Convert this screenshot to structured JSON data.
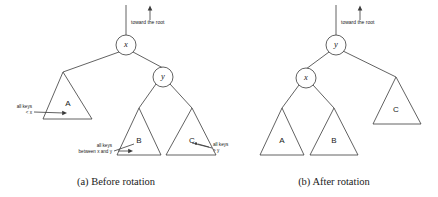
{
  "figure": {
    "background_color": "#ffffff",
    "stroke_color": "#3a3a3a",
    "text_color": "#1a1a1a"
  },
  "panels": [
    {
      "id": "before",
      "caption": "(a)  Before rotation",
      "root_pointer_label": "toward the root",
      "root_pointer_icon": "up-arrow-icon",
      "nodes": [
        {
          "id": "x",
          "label": "x"
        },
        {
          "id": "y",
          "label": "y"
        }
      ],
      "subtrees": [
        {
          "id": "A",
          "label": "A"
        },
        {
          "id": "B",
          "label": "B"
        },
        {
          "id": "C",
          "label": "C"
        }
      ],
      "annotations": [
        {
          "id": "keys-lt-x",
          "lines": [
            "all keys",
            "< x"
          ],
          "target": "A"
        },
        {
          "id": "keys-between",
          "lines": [
            "all keys",
            "between x and y"
          ],
          "target": "B"
        },
        {
          "id": "keys-gt-y",
          "lines": [
            "all keys",
            "> y"
          ],
          "target": "C"
        }
      ]
    },
    {
      "id": "after",
      "caption": "(b)  After rotation",
      "root_pointer_label": "toward the root",
      "root_pointer_icon": "up-arrow-icon",
      "nodes": [
        {
          "id": "y",
          "label": "y"
        },
        {
          "id": "x",
          "label": "x"
        }
      ],
      "subtrees": [
        {
          "id": "A",
          "label": "A"
        },
        {
          "id": "B",
          "label": "B"
        },
        {
          "id": "C",
          "label": "C"
        }
      ],
      "annotations": []
    }
  ]
}
